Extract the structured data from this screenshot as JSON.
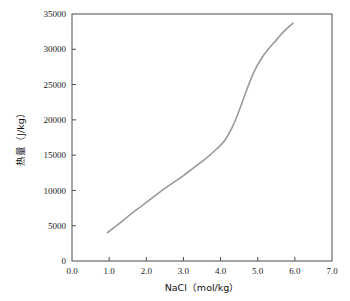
{
  "chart_data": {
    "type": "line",
    "title": "",
    "xlabel": "NaCl（mol/kg）",
    "ylabel": "热量（J/kg）",
    "xlim": [
      0.0,
      7.0
    ],
    "ylim": [
      0,
      35000
    ],
    "grid": false,
    "legend": null,
    "xticks": [
      "0.0",
      "1.0",
      "2.0",
      "3.0",
      "4.0",
      "5.0",
      "6.0",
      "7.0"
    ],
    "xtick_values": [
      0.0,
      1.0,
      2.0,
      3.0,
      4.0,
      5.0,
      6.0,
      7.0
    ],
    "yticks": [
      "0",
      "5000",
      "10000",
      "15000",
      "20000",
      "25000",
      "30000",
      "35000"
    ],
    "ytick_values": [
      0,
      5000,
      10000,
      15000,
      20000,
      25000,
      30000,
      35000
    ],
    "series": [
      {
        "name": "热量",
        "color": "#9a9a9a",
        "x": [
          0.95,
          1.2,
          1.5,
          1.8,
          2.1,
          2.4,
          2.7,
          3.0,
          3.3,
          3.6,
          3.9,
          4.1,
          4.3,
          4.5,
          4.7,
          4.9,
          5.1,
          5.3,
          5.5,
          5.7,
          5.95
        ],
        "y": [
          4000,
          5000,
          6300,
          7500,
          8700,
          9900,
          11000,
          12100,
          13300,
          14500,
          15900,
          17000,
          18800,
          21300,
          24200,
          26800,
          28700,
          30100,
          31300,
          32500,
          33700
        ]
      }
    ]
  },
  "axis_labels": {
    "x_title": "NaCl（mol/kg）",
    "y_title": "热量（J/kg）"
  }
}
